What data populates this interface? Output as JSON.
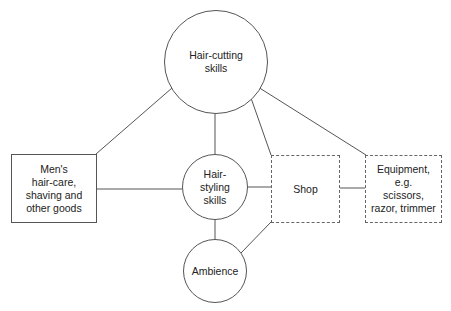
{
  "diagram": {
    "nodes": {
      "hair_cutting": {
        "label": "Hair-cutting\nskills",
        "shape": "circle"
      },
      "hair_styling": {
        "label": "Hair-\nstyling\nskills",
        "shape": "circle"
      },
      "ambience": {
        "label": "Ambience",
        "shape": "circle"
      },
      "mens_goods": {
        "label": "Men's\nhair-care,\nshaving and\nother goods",
        "shape": "solid-box"
      },
      "shop": {
        "label": "Shop",
        "shape": "dashed-box"
      },
      "equipment": {
        "label": "Equipment,\ne.g.\nscissors,\nrazor, trimmer",
        "shape": "dashed-box"
      }
    },
    "edges": [
      {
        "from": "hair_cutting",
        "to": "mens_goods"
      },
      {
        "from": "hair_cutting",
        "to": "hair_styling"
      },
      {
        "from": "hair_cutting",
        "to": "shop"
      },
      {
        "from": "hair_cutting",
        "to": "equipment"
      },
      {
        "from": "mens_goods",
        "to": "hair_styling"
      },
      {
        "from": "hair_styling",
        "to": "shop"
      },
      {
        "from": "shop",
        "to": "equipment"
      },
      {
        "from": "hair_styling",
        "to": "ambience"
      },
      {
        "from": "ambience",
        "to": "shop"
      }
    ],
    "colors": {
      "line": "#555555",
      "text": "#222222",
      "background": "#ffffff"
    }
  }
}
